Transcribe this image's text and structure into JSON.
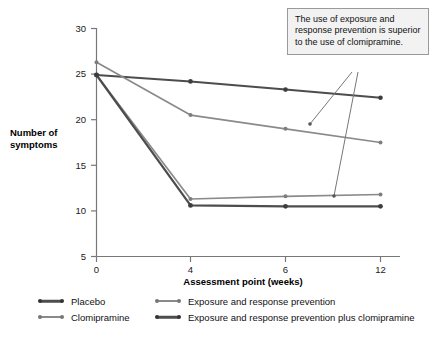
{
  "chart_data": {
    "type": "line",
    "title": "",
    "xlabel": "Assessment point (weeks)",
    "ylabel": "Number of symptoms",
    "categories": [
      "0",
      "4",
      "6",
      "12"
    ],
    "x": [
      0,
      4,
      6,
      12
    ],
    "xtick_labels": [
      "0",
      "4",
      "6",
      "12"
    ],
    "ytick_labels": [
      "5",
      "10",
      "15",
      "20",
      "25",
      "30"
    ],
    "yticks": [
      5,
      10,
      15,
      20,
      25,
      30
    ],
    "ylim": [
      5,
      30
    ],
    "grid": false,
    "legend_position": "below",
    "series": [
      {
        "name": "Placebo",
        "color": "#4d4d4d",
        "values": [
          24.9,
          24.2,
          23.3,
          22.4
        ]
      },
      {
        "name": "Clomipramine",
        "color": "#8a8a8a",
        "values": [
          26.3,
          20.5,
          19.0,
          17.5
        ]
      },
      {
        "name": "Exposure and response prevention",
        "color": "#8a8a8a",
        "values": [
          24.9,
          11.3,
          11.6,
          11.8
        ]
      },
      {
        "name": "Exposure and response prevention plus clomipramine",
        "color": "#4d4d4d",
        "values": [
          24.9,
          10.6,
          10.5,
          10.5
        ]
      }
    ],
    "annotations": [
      {
        "text": "The use of exposure and response prevention is superior to the use of clomipramine.",
        "points_to": [
          "Exposure and response prevention line",
          "Exposure and response prevention cluster"
        ]
      }
    ]
  },
  "axis": {
    "y_caption_line1": "Number of",
    "y_caption_line2": "symptoms",
    "x_title": "Assessment point (weeks)"
  },
  "callout": {
    "text": "The use of exposure and response prevention is superior to the use of clomipramine."
  },
  "legend": {
    "items": [
      {
        "label": "Placebo",
        "color": "#4d4d4d"
      },
      {
        "label": "Clomipramine",
        "color": "#8a8a8a"
      },
      {
        "label": "Exposure and response prevention",
        "color": "#8a8a8a"
      },
      {
        "label": "Exposure and response prevention plus clomipramine",
        "color": "#4d4d4d"
      }
    ]
  },
  "colors": {
    "dark_series": "#4d4d4d",
    "light_series": "#8a8a8a",
    "axis": "#777777",
    "callout_bg": "#f2f2f2",
    "callout_border": "#9a9a9a"
  }
}
